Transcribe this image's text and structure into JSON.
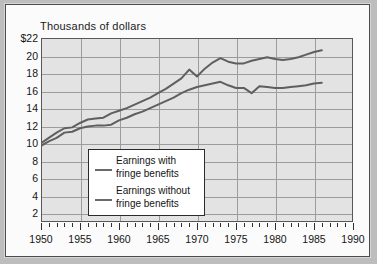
{
  "figure": {
    "title": "Thousands of dollars"
  },
  "legend": {
    "items": [
      {
        "label_line1": "Earnings with",
        "label_line2": "fringe benefits",
        "color": "#6a6a6a"
      },
      {
        "label_line1": "Earnings without",
        "label_line2": "fringe benefits",
        "color": "#6a6a6a"
      }
    ]
  },
  "colors": {
    "page_background": "#bdbdbd",
    "card_background": "#fbfbfb",
    "plot_background": "#e3e3e3",
    "gridline": "#9a9c9e",
    "axis": "#56585a",
    "series_with": "#5f5f5f",
    "series_without": "#5f5f5f",
    "text": "#151515"
  },
  "chart_data": {
    "type": "line",
    "title": "Thousands of dollars",
    "xlabel": "",
    "ylabel": "Thousands of dollars",
    "xlim": [
      1950,
      1990
    ],
    "ylim": [
      1,
      22
    ],
    "grid": true,
    "legend_position": "lower-left-inside",
    "ytick_labels": [
      "$22",
      "20",
      "18",
      "16",
      "14",
      "12",
      "10",
      "8",
      "6",
      "4",
      "2"
    ],
    "ytick_values": [
      22,
      20,
      18,
      16,
      14,
      12,
      10,
      8,
      6,
      4,
      2
    ],
    "xtick_labels": [
      "1950",
      "1955",
      "1960",
      "1965",
      "1970",
      "1975",
      "1980",
      "1985",
      "1990"
    ],
    "xtick_values": [
      1950,
      1955,
      1960,
      1965,
      1970,
      1975,
      1980,
      1985,
      1990
    ],
    "minor_xticks_every": 1,
    "x": [
      1950,
      1951,
      1952,
      1953,
      1954,
      1955,
      1956,
      1957,
      1958,
      1959,
      1960,
      1961,
      1962,
      1963,
      1964,
      1965,
      1966,
      1967,
      1968,
      1969,
      1970,
      1971,
      1972,
      1973,
      1974,
      1975,
      1976,
      1977,
      1978,
      1979,
      1980,
      1981,
      1982,
      1983,
      1984,
      1985,
      1986
    ],
    "series": [
      {
        "name": "Earnings with fringe benefits",
        "values": [
          10.0,
          10.6,
          11.2,
          11.7,
          11.8,
          12.3,
          12.7,
          12.8,
          12.9,
          13.4,
          13.7,
          14.0,
          14.4,
          14.8,
          15.2,
          15.7,
          16.2,
          16.8,
          17.4,
          18.4,
          17.6,
          18.5,
          19.2,
          19.7,
          19.3,
          19.1,
          19.1,
          19.4,
          19.6,
          19.8,
          19.6,
          19.5,
          19.6,
          19.8,
          20.1,
          20.4,
          20.6
        ]
      },
      {
        "name": "Earnings without fringe benefits",
        "values": [
          9.7,
          10.2,
          10.6,
          11.2,
          11.3,
          11.7,
          11.9,
          12.0,
          12.0,
          12.1,
          12.6,
          12.9,
          13.3,
          13.6,
          14.0,
          14.4,
          14.8,
          15.2,
          15.7,
          16.1,
          16.4,
          16.6,
          16.8,
          17.0,
          16.6,
          16.3,
          16.3,
          15.7,
          16.5,
          16.4,
          16.3,
          16.3,
          16.4,
          16.5,
          16.6,
          16.8,
          16.9
        ]
      }
    ]
  }
}
